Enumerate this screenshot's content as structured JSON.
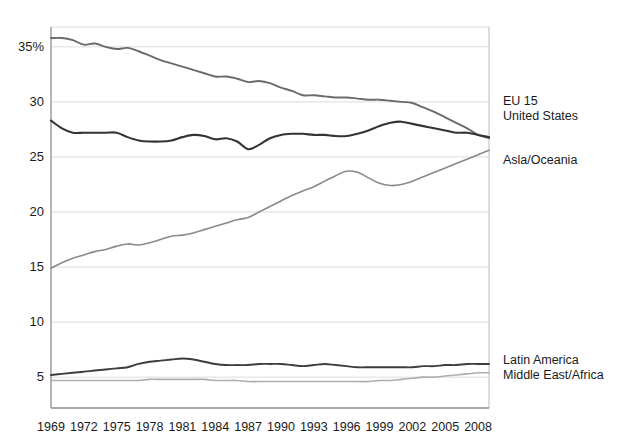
{
  "chart_data": {
    "type": "line",
    "title": "",
    "subtitle": "",
    "xlabel": "",
    "ylabel": "",
    "xlim": [
      1969,
      2009
    ],
    "ylim": [
      2.2,
      36.8
    ],
    "grid": true,
    "grid_axis": "y",
    "legend_position": "right-inline",
    "y_ticks": [
      5,
      10,
      15,
      20,
      25,
      30,
      35
    ],
    "y_tick_labels": [
      "5",
      "10",
      "15",
      "20",
      "25",
      "30",
      "35",
      "35%"
    ],
    "x_ticks": [
      1969,
      1972,
      1975,
      1978,
      1981,
      1984,
      1987,
      1990,
      1993,
      1996,
      1999,
      2002,
      2005,
      2008
    ],
    "x_tick_labels": [
      "1969",
      "1972",
      "1975",
      "1978",
      "1981",
      "1984",
      "1987",
      "1990",
      "1993",
      "1996",
      "1999",
      "2002",
      "2005",
      "2008"
    ],
    "x": [
      1969,
      1970,
      1971,
      1972,
      1973,
      1974,
      1975,
      1976,
      1977,
      1978,
      1979,
      1980,
      1981,
      1982,
      1983,
      1984,
      1985,
      1986,
      1987,
      1988,
      1989,
      1990,
      1991,
      1992,
      1993,
      1994,
      1995,
      1996,
      1997,
      1998,
      1999,
      2000,
      2001,
      2002,
      2003,
      2004,
      2005,
      2006,
      2007,
      2008,
      2009
    ],
    "series": [
      {
        "name": "EU 15",
        "color": "#6b6b6b",
        "width": 1.9,
        "label_y_value": 30.0,
        "values": [
          35.8,
          35.8,
          35.6,
          35.2,
          35.3,
          35.0,
          34.8,
          34.9,
          34.6,
          34.2,
          33.8,
          33.5,
          33.2,
          32.9,
          32.6,
          32.3,
          32.3,
          32.1,
          31.8,
          31.9,
          31.7,
          31.3,
          31.0,
          30.6,
          30.6,
          30.5,
          30.4,
          30.4,
          30.3,
          30.2,
          30.2,
          30.1,
          30.0,
          29.9,
          29.5,
          29.1,
          28.6,
          28.1,
          27.6,
          27.0,
          26.7
        ]
      },
      {
        "name": "United States",
        "color": "#333333",
        "width": 2.1,
        "label_y_value": 28.6,
        "values": [
          28.3,
          27.6,
          27.2,
          27.2,
          27.2,
          27.2,
          27.2,
          26.8,
          26.5,
          26.4,
          26.4,
          26.5,
          26.8,
          27.0,
          26.9,
          26.6,
          26.7,
          26.4,
          25.7,
          26.1,
          26.7,
          27.0,
          27.1,
          27.1,
          27.0,
          27.0,
          26.9,
          26.9,
          27.1,
          27.4,
          27.8,
          28.1,
          28.2,
          28.0,
          27.8,
          27.6,
          27.4,
          27.2,
          27.2,
          27.0,
          26.8
        ]
      },
      {
        "name": "Asla/Oceania",
        "color": "#8a8a8a",
        "width": 1.6,
        "label_y_value": 24.6,
        "values": [
          14.9,
          15.4,
          15.8,
          16.1,
          16.4,
          16.6,
          16.9,
          17.1,
          17.0,
          17.2,
          17.5,
          17.8,
          17.9,
          18.1,
          18.4,
          18.7,
          19.0,
          19.3,
          19.5,
          20.0,
          20.5,
          21.0,
          21.5,
          21.9,
          22.3,
          22.8,
          23.3,
          23.7,
          23.6,
          23.1,
          22.6,
          22.4,
          22.5,
          22.8,
          23.2,
          23.6,
          24.0,
          24.4,
          24.8,
          25.2,
          25.6
        ]
      },
      {
        "name": "Latin America",
        "color": "#3d3d3d",
        "width": 1.9,
        "label_y_value": 6.5,
        "values": [
          5.2,
          5.3,
          5.4,
          5.5,
          5.6,
          5.7,
          5.8,
          5.9,
          6.2,
          6.4,
          6.5,
          6.6,
          6.7,
          6.6,
          6.4,
          6.2,
          6.1,
          6.1,
          6.1,
          6.2,
          6.2,
          6.2,
          6.1,
          6.0,
          6.1,
          6.2,
          6.1,
          6.0,
          5.9,
          5.9,
          5.9,
          5.9,
          5.9,
          5.9,
          6.0,
          6.0,
          6.1,
          6.1,
          6.2,
          6.2,
          6.2
        ]
      },
      {
        "name": "Middle East/Africa",
        "color": "#aeaeae",
        "width": 1.6,
        "label_y_value": 5.1,
        "values": [
          4.7,
          4.7,
          4.7,
          4.7,
          4.7,
          4.7,
          4.7,
          4.7,
          4.7,
          4.8,
          4.8,
          4.8,
          4.8,
          4.8,
          4.8,
          4.7,
          4.7,
          4.7,
          4.6,
          4.6,
          4.6,
          4.6,
          4.6,
          4.6,
          4.6,
          4.6,
          4.6,
          4.6,
          4.6,
          4.6,
          4.7,
          4.7,
          4.8,
          4.9,
          5.0,
          5.0,
          5.1,
          5.2,
          5.3,
          5.4,
          5.4
        ]
      }
    ]
  },
  "style": {
    "axis_color": "#8d8d8d",
    "grid_color": "#dcdcdc",
    "background": "#ffffff",
    "text_color": "#1a1a1a"
  },
  "plot_geometry": {
    "left": 51,
    "right": 489,
    "top": 27,
    "bottom": 408
  }
}
